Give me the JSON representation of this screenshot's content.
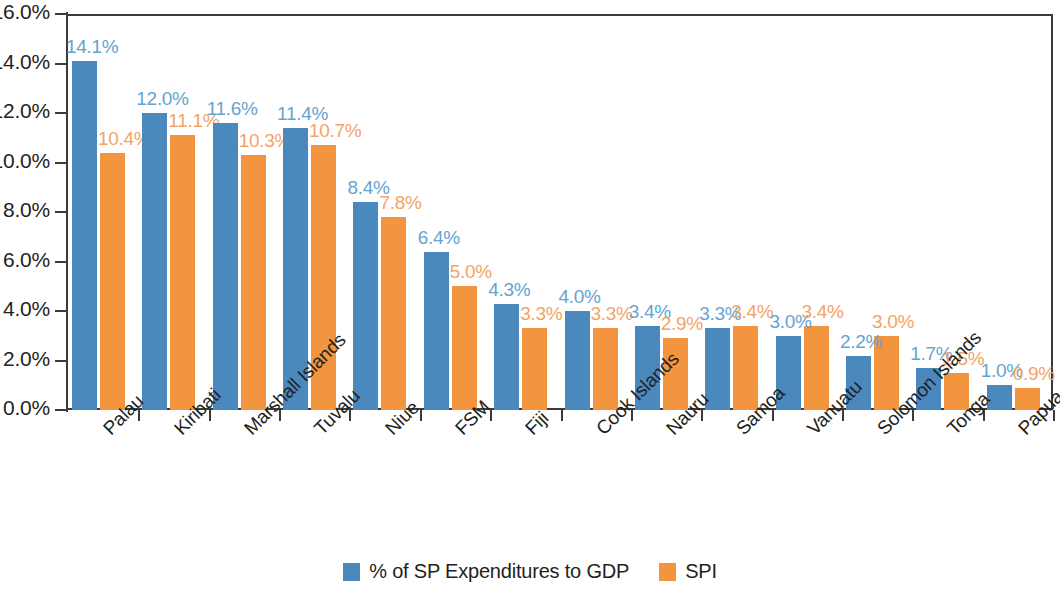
{
  "chart_data": {
    "type": "bar",
    "title": "",
    "xlabel": "",
    "ylabel": "",
    "ylim": [
      0,
      16
    ],
    "ytick_labels": [
      "0.0%",
      "2.0%",
      "4.0%",
      "6.0%",
      "8.0%",
      "10.0%",
      "12.0%",
      "14.0%",
      "16.0%"
    ],
    "ytick_values": [
      0,
      2,
      4,
      6,
      8,
      10,
      12,
      14,
      16
    ],
    "grid": false,
    "legend_position": "bottom-center",
    "categories": [
      "Palau",
      "Kiribati",
      "Marshall Islands",
      "Tuvalu",
      "Niue",
      "FSM",
      "Fiji",
      "Cook Islands",
      "Nauru",
      "Samoa",
      "Vanuatu",
      "Solomon Islands",
      "Tonga",
      "Papua New Guinea"
    ],
    "series": [
      {
        "name": "% of SP Expenditures to GDP",
        "color": "#4a88be",
        "label_color": "#66a3d0",
        "values": [
          14.1,
          12.0,
          11.6,
          11.4,
          8.4,
          6.4,
          4.3,
          4.0,
          3.4,
          3.3,
          3.0,
          2.2,
          1.7,
          1.0
        ],
        "value_labels": [
          "14.1%",
          "12.0%",
          "11.6%",
          "11.4%",
          "8.4%",
          "6.4%",
          "4.3%",
          "4.0%",
          "3.4%",
          "3.3%",
          "3.0%",
          "2.2%",
          "1.7%",
          "1.0%"
        ]
      },
      {
        "name": "SPI",
        "color": "#f3953f",
        "label_color": "#f3a368",
        "values": [
          10.4,
          11.1,
          10.3,
          10.7,
          7.8,
          5.0,
          3.3,
          3.3,
          2.9,
          3.4,
          3.4,
          3.0,
          1.5,
          0.9
        ],
        "value_labels": [
          "10.4%",
          "11.1%",
          "10.3%",
          "10.7%",
          "7.8%",
          "5.0%",
          "3.3%",
          "3.3%",
          "2.9%",
          "3.4%",
          "3.4%",
          "3.0%",
          "1.5%",
          "0.9%"
        ]
      }
    ]
  },
  "legend": {
    "items": [
      {
        "label": "% of SP Expenditures to GDP",
        "color": "#4a88be"
      },
      {
        "label": "SPI",
        "color": "#f3953f"
      }
    ]
  }
}
